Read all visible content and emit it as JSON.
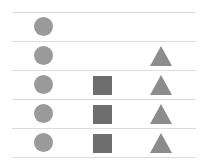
{
  "diagram": {
    "colors": {
      "circle": "#9a9a9a",
      "square": "#6e6e6e",
      "triangle": "#8c8c8c",
      "line": "#dcdcdc"
    },
    "rows": [
      {
        "circle": true,
        "square": false,
        "triangle": false
      },
      {
        "circle": true,
        "square": false,
        "triangle": true
      },
      {
        "circle": true,
        "square": true,
        "triangle": true
      },
      {
        "circle": true,
        "square": true,
        "triangle": true
      },
      {
        "circle": true,
        "square": true,
        "triangle": true
      }
    ],
    "counts": {
      "circles": 5,
      "squares": 3,
      "triangles": 4
    }
  }
}
